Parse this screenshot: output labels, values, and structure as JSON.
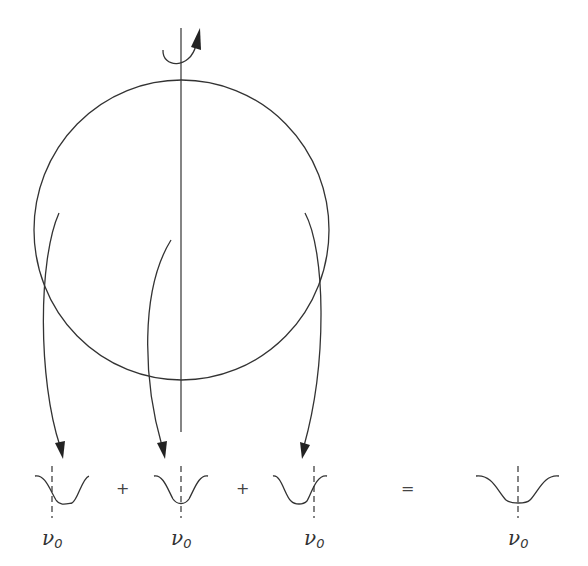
{
  "figure": {
    "rotation_axis": {
      "has_rotation_arrow": true
    },
    "star": {
      "shape": "circle"
    },
    "arrows": [
      {
        "from": "left-limb",
        "to": "profile-1"
      },
      {
        "from": "center",
        "to": "profile-2"
      },
      {
        "from": "right-limb",
        "to": "profile-3"
      }
    ],
    "equation": {
      "operators": [
        "+",
        "+",
        "="
      ],
      "profiles": [
        {
          "name": "left-limb-profile",
          "shift": "red-shifted",
          "label_symbol": "ν",
          "label_subscript": "0"
        },
        {
          "name": "center-profile",
          "shift": "none",
          "label_symbol": "ν",
          "label_subscript": "0"
        },
        {
          "name": "right-limb-profile",
          "shift": "blue-shifted",
          "label_symbol": "ν",
          "label_subscript": "0"
        },
        {
          "name": "broadened-profile",
          "shift": "none (broadened)",
          "label_symbol": "ν",
          "label_subscript": "0"
        }
      ]
    }
  }
}
